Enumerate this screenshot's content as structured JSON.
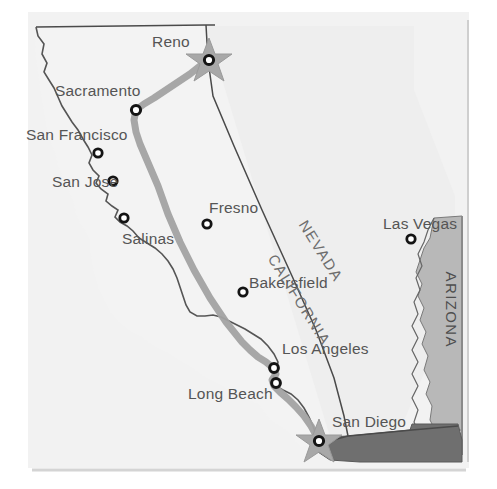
{
  "map": {
    "title": "California Route Map",
    "background_color": "#ffffff",
    "land_fill": "#f0f0f0",
    "neighbor_fill": "#ededed",
    "arizona_fill": "#b8b8b8",
    "mexico_fill": "#6f6f6f",
    "outline_color": "#4a4a4a",
    "route_color": "#a2a2a2",
    "label_color": "#5a5a5a",
    "marker_fill": "#ffffff",
    "marker_stroke": "#1a1a1a",
    "star_fill": "#a8a8a8"
  },
  "states": [
    {
      "name": "CALIFORNIA",
      "x": 272,
      "y": 247,
      "rotation": -58,
      "style": "diagonal"
    },
    {
      "name": "NEVADA",
      "x": 303,
      "y": 213,
      "rotation": -58,
      "style": "diagonal"
    },
    {
      "name": "ARIZONA",
      "x": 451,
      "y": 263,
      "rotation": 90,
      "style": "vertical"
    }
  ],
  "cities": [
    {
      "name": "Reno",
      "label_x": 152,
      "label_y": 33,
      "dot_x": 209,
      "dot_y": 60,
      "marker": "star",
      "on_route": true
    },
    {
      "name": "Sacramento",
      "label_x": 55,
      "label_y": 82,
      "dot_x": 136,
      "dot_y": 110,
      "marker": "circle",
      "on_route": true
    },
    {
      "name": "San Francisco",
      "label_x": 26,
      "label_y": 126,
      "dot_x": 98,
      "dot_y": 153,
      "marker": "circle",
      "on_route": false
    },
    {
      "name": "San Jose",
      "label_x": 52,
      "label_y": 173,
      "dot_x": 113,
      "dot_y": 181,
      "marker": "circle",
      "on_route": false
    },
    {
      "name": "Salinas",
      "label_x": 122,
      "label_y": 230,
      "dot_x": 124,
      "dot_y": 218,
      "marker": "circle",
      "on_route": false
    },
    {
      "name": "Fresno",
      "label_x": 209,
      "label_y": 199,
      "dot_x": 207,
      "dot_y": 224,
      "marker": "circle",
      "on_route": false
    },
    {
      "name": "Bakersfield",
      "label_x": 249,
      "label_y": 274,
      "dot_x": 243,
      "dot_y": 292,
      "marker": "circle",
      "on_route": false
    },
    {
      "name": "Los Angeles",
      "label_x": 282,
      "label_y": 340,
      "dot_x": 274,
      "dot_y": 368,
      "marker": "circle",
      "on_route": true
    },
    {
      "name": "Long Beach",
      "label_x": 188,
      "label_y": 385,
      "dot_x": 276,
      "dot_y": 383,
      "marker": "circle",
      "on_route": true
    },
    {
      "name": "San Diego",
      "label_x": 332,
      "label_y": 413,
      "dot_x": 319,
      "dot_y": 441,
      "marker": "star",
      "on_route": true
    },
    {
      "name": "Las Vegas",
      "label_x": 383,
      "label_y": 215,
      "dot_x": 411,
      "dot_y": 239,
      "marker": "circle",
      "on_route": false
    }
  ],
  "route": {
    "name": "highway-route",
    "from": "Reno",
    "to": "San Diego",
    "waypoints": [
      "Reno",
      "Sacramento",
      "Los Angeles",
      "Long Beach",
      "San Diego"
    ],
    "stroke_width": 7
  }
}
